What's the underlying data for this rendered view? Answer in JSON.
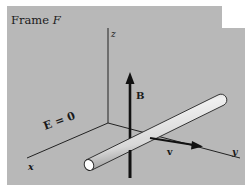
{
  "figure": {
    "title": "Frame",
    "title_symbol": "F",
    "axes": {
      "x_label": "x",
      "y_label": "y",
      "z_label": "z"
    },
    "field_labels": {
      "magnetic": "B",
      "electric": "E = 0",
      "velocity": "v"
    },
    "colors": {
      "panel": "#b8b8b8",
      "ink": "#1a1a1a",
      "rod_light": "#f0f0f0",
      "rod_mid": "#d8d8d8",
      "rod_shadow": "#9a9a9a"
    }
  }
}
